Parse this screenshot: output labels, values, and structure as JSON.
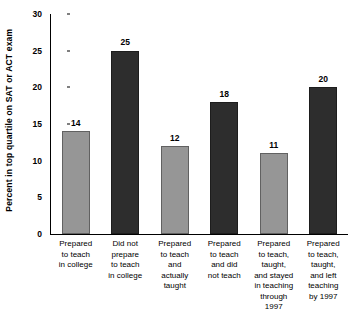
{
  "chart_data": {
    "type": "bar",
    "title": "",
    "subtitle": "",
    "xlabel": "",
    "ylabel": "Percent in top quartile on SAT or ACT exam",
    "ylim": [
      0,
      30
    ],
    "yticks": [
      0,
      5,
      10,
      15,
      20,
      25,
      30
    ],
    "ytick_labels": [
      "0",
      "5",
      "10",
      "15",
      "20",
      "25",
      "30"
    ],
    "grid": false,
    "legend": "none",
    "categories": [
      "Prepared\nto teach\nin college",
      "Did not\nprepare\nto teach\nin college",
      "Prepared\nto teach\nand\nactually\ntaught",
      "Prepared\nto teach\nand did\nnot teach",
      "Prepared\nto teach,\ntaught,\nand stayed\nin teaching\nthrough\n1997",
      "Prepared\nto teach,\ntaught,\nand left\nteaching\nby 1997"
    ],
    "values": [
      14,
      25,
      12,
      18,
      11,
      20
    ],
    "value_labels": [
      "14",
      "25",
      "12",
      "18",
      "11",
      "20"
    ],
    "bar_colors": [
      "#969696",
      "#2d2d2d",
      "#969696",
      "#2d2d2d",
      "#969696",
      "#2d2d2d"
    ],
    "colors": {
      "light_bar": "#969696",
      "dark_bar": "#2d2d2d",
      "axis": "#000000",
      "background": "#ffffff",
      "text": "#000000"
    }
  }
}
